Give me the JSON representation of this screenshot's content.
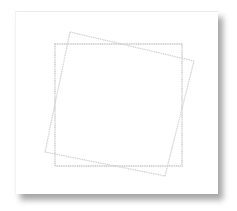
{
  "canvas": {
    "width": 237,
    "height": 211,
    "background": "#ffffff"
  },
  "card": {
    "background": "#ffffff",
    "shadow_color": "#9a9a9a"
  },
  "shapes": [
    {
      "type": "square",
      "label": "axis-aligned-square",
      "corners": [
        [
          55,
          44
        ],
        [
          182,
          44
        ],
        [
          182,
          166
        ],
        [
          55,
          166
        ]
      ],
      "stroke": "#c8c8c8"
    },
    {
      "type": "square",
      "label": "rotated-square",
      "corners": [
        [
          70,
          32
        ],
        [
          194,
          61
        ],
        [
          165,
          176
        ],
        [
          45,
          152
        ]
      ],
      "stroke": "#d4d4d4"
    }
  ]
}
